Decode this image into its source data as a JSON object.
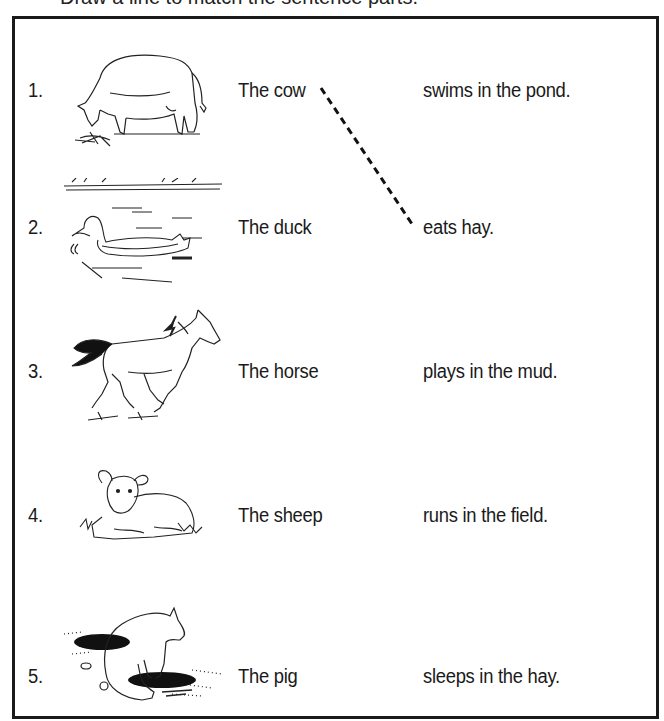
{
  "worksheet": {
    "heading_partial": "Draw a line to match the sentence parts.",
    "rows": [
      {
        "number": "1.",
        "picture": "cow",
        "subject": "The cow",
        "predicate": "swims in the pond."
      },
      {
        "number": "2.",
        "picture": "duck",
        "subject": "The duck",
        "predicate": "eats hay."
      },
      {
        "number": "3.",
        "picture": "horse",
        "subject": "The horse",
        "predicate": "plays in the mud."
      },
      {
        "number": "4.",
        "picture": "sheep",
        "subject": "The sheep",
        "predicate": "runs in the field."
      },
      {
        "number": "5.",
        "picture": "pig",
        "subject": "The pig",
        "predicate": "sleeps in the hay."
      }
    ],
    "matches_drawn": [
      {
        "from_subject": "The cow",
        "to_predicate": "eats hay.",
        "style": "dashed"
      }
    ]
  }
}
